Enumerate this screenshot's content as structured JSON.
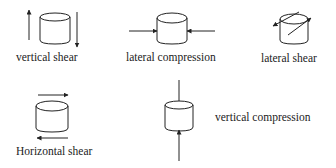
{
  "diagram": {
    "items": [
      {
        "id": "vertical-shear",
        "label": "vertical shear"
      },
      {
        "id": "lateral-compression",
        "label": "lateral compression"
      },
      {
        "id": "lateral-shear",
        "label": "lateral shear"
      },
      {
        "id": "horizontal-shear",
        "label": "Horizontal shear"
      },
      {
        "id": "vertical-compression",
        "label": "vertical compression"
      }
    ],
    "colors": {
      "stroke": "#222222",
      "background": "#ffffff"
    }
  }
}
